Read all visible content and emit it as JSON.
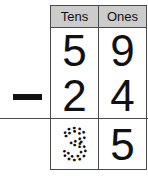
{
  "worksheet": {
    "type": "vertical-subtraction-place-value",
    "operator_symbol": "−",
    "operator_name": "minus-sign"
  },
  "table": {
    "headers": [
      {
        "label": "Tens",
        "name": "tens"
      },
      {
        "label": "Ones",
        "name": "ones"
      }
    ],
    "rows": [
      {
        "role": "minuend",
        "cells": [
          {
            "value": "5",
            "style": "solid"
          },
          {
            "value": "9",
            "style": "solid"
          }
        ]
      },
      {
        "role": "subtrahend",
        "cells": [
          {
            "value": "2",
            "style": "solid"
          },
          {
            "value": "4",
            "style": "solid"
          }
        ]
      },
      {
        "role": "answer",
        "cells": [
          {
            "value": "3",
            "style": "dotted-trace"
          },
          {
            "value": "5",
            "style": "solid"
          }
        ]
      }
    ]
  },
  "colors": {
    "header_background": "#cccccc",
    "border": "#4a4a4a",
    "digit": "#111111",
    "page_background": "#ffffff"
  }
}
